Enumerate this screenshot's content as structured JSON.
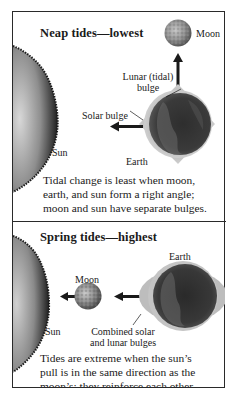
{
  "figure": {
    "colors": {
      "border": "#2a2a2a",
      "text": "#1a1a1a",
      "bulge": "#b9b9b9",
      "sun_dark": "#1e1e1e",
      "sun_light": "#cfcfcf",
      "earth_dark": "#262626",
      "moon": "#8a8a8a"
    },
    "neap": {
      "title": "Neap tides—lowest",
      "labels": {
        "moon": "Moon",
        "lunar_bulge_line1": "Lunar (tidal)",
        "lunar_bulge_line2": "bulge",
        "solar_bulge": "Solar bulge",
        "sun": "Sun",
        "earth": "Earth"
      },
      "caption": [
        "Tidal change is least when moon,",
        "earth, and sun form a right angle;",
        "moon and sun have separate bulges."
      ],
      "arrows": [
        {
          "name": "pull-toward-moon",
          "direction": "up"
        },
        {
          "name": "pull-toward-sun",
          "direction": "left"
        }
      ]
    },
    "spring": {
      "title": "Spring tides—highest",
      "labels": {
        "earth": "Earth",
        "moon": "Moon",
        "sun": "Sun",
        "combined_line1": "Combined solar",
        "combined_line2": "and lunar bulges"
      },
      "caption": [
        "Tides are extreme when the sun’s",
        "pull is in the same direction as the",
        "moon’s; they reinforce each other."
      ],
      "arrows": [
        {
          "name": "pull-toward-sun-from-moon",
          "direction": "left"
        },
        {
          "name": "pull-toward-moon-from-earth",
          "direction": "left"
        }
      ]
    }
  }
}
